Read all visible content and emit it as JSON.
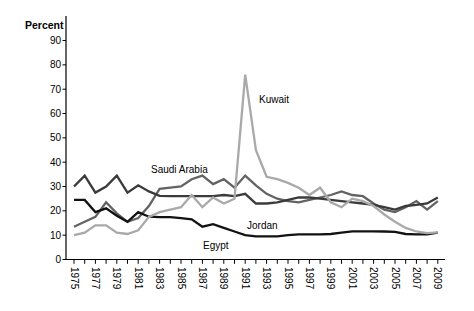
{
  "figure": {
    "y_axis_title": "Percent",
    "y_ticks": [
      0,
      10,
      20,
      30,
      40,
      50,
      60,
      70,
      80,
      90
    ],
    "x_tick_labels": [
      "1975",
      "1977",
      "1979",
      "1981",
      "1983",
      "1985",
      "1987",
      "1989",
      "1991",
      "1993",
      "1995",
      "1997",
      "1999",
      "2001",
      "2003",
      "2005",
      "2007",
      "2009"
    ]
  },
  "chart_data": {
    "type": "line",
    "title": "",
    "xlabel": "",
    "ylabel": "Percent",
    "ylim": [
      0,
      95
    ],
    "xlim": [
      1975,
      2009
    ],
    "grid": false,
    "legend_position": "inline-annotations",
    "x": [
      1975,
      1976,
      1977,
      1978,
      1979,
      1980,
      1981,
      1982,
      1983,
      1984,
      1985,
      1986,
      1987,
      1988,
      1989,
      1990,
      1991,
      1992,
      1993,
      1994,
      1995,
      1996,
      1997,
      1998,
      1999,
      2000,
      2001,
      2002,
      2003,
      2004,
      2005,
      2006,
      2007,
      2008,
      2009
    ],
    "series": [
      {
        "name": "Saudi Arabia",
        "color": "#636363",
        "values": [
          13.5,
          15.5,
          17.5,
          23.5,
          19,
          15.5,
          17,
          22,
          29,
          29.5,
          30,
          33,
          34.5,
          31,
          33,
          29.5,
          34.5,
          30.5,
          27,
          25,
          24,
          23.5,
          24.5,
          25.5,
          26.5,
          28,
          26.5,
          26,
          23,
          20.5,
          19.5,
          21.5,
          24,
          20.5,
          24
        ]
      },
      {
        "name": "Jordan",
        "color": "#3b3b3b",
        "values": [
          30,
          34.5,
          27.5,
          30,
          34.5,
          27.5,
          30.5,
          28,
          26.2,
          26,
          26,
          26,
          26,
          26,
          26.5,
          26,
          27,
          23,
          23,
          23.5,
          24.5,
          25.5,
          25.5,
          25,
          24.5,
          24,
          23.5,
          23,
          22.5,
          21.5,
          20.5,
          22,
          22.5,
          23,
          25.5
        ]
      },
      {
        "name": "Egypt",
        "color": "#121212",
        "values": [
          24.5,
          24.5,
          19.5,
          21,
          18,
          15.5,
          19.5,
          17.6,
          17.4,
          17.4,
          17,
          16.5,
          13.5,
          14.5,
          13,
          11.5,
          10,
          9.5,
          9.5,
          9.5,
          10,
          10.3,
          10.3,
          10.3,
          10.5,
          11,
          11.6,
          11.6,
          11.6,
          11.5,
          11.4,
          10.5,
          10.3,
          10.3,
          11
        ]
      },
      {
        "name": "Kuwait",
        "color": "#a9a9a9",
        "values": [
          10,
          11,
          14,
          14,
          11,
          10.5,
          12,
          17.5,
          19.5,
          20.5,
          21.5,
          26.5,
          21.5,
          25.5,
          23,
          25,
          76,
          45,
          34,
          33,
          31.5,
          29.5,
          26.5,
          29.5,
          23.5,
          21.5,
          25,
          24,
          22,
          18.5,
          15.5,
          13,
          11.5,
          10.8,
          11.2
        ]
      }
    ],
    "annotations": [
      {
        "text": "Saudi Arabia",
        "px": [
          151,
          173
        ],
        "color": "#3f3f3f"
      },
      {
        "text": "Kuwait",
        "px": [
          259,
          103
        ],
        "color": "#5a5a5a"
      },
      {
        "text": "Jordan",
        "px": [
          247,
          229
        ],
        "color": "#2e2e2e"
      },
      {
        "text": "Egypt",
        "px": [
          203,
          249
        ],
        "color": "#1a1a1a"
      }
    ]
  }
}
